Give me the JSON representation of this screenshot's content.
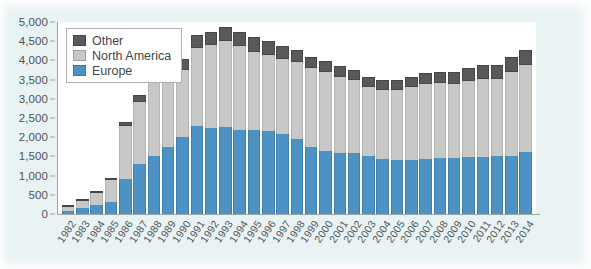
{
  "chart_data": {
    "type": "bar",
    "stacked": true,
    "title": "",
    "subtitle": "",
    "xlabel": "",
    "ylabel": "",
    "ylim": [
      0,
      5000
    ],
    "ytick_step": 500,
    "ytick_labels": [
      "0",
      "500",
      "1,000",
      "1,500",
      "2,000",
      "2,500",
      "3,000",
      "3,500",
      "4,000",
      "4,500",
      "5,000"
    ],
    "grid": false,
    "legend_position": "top-left",
    "legend_entries": [
      "Other",
      "North America",
      "Europe"
    ],
    "colors": {
      "other": "#58595b",
      "north_america": "#c8c9c6",
      "europe": "#4d92c4",
      "background": "#eaf3f4",
      "plot_background": "#ffffff",
      "axis": "#9aa6a8",
      "text": "#4b5356"
    },
    "categories": [
      "1982",
      "1983",
      "1984",
      "1985",
      "1986",
      "1987",
      "1988",
      "1989",
      "1990",
      "1991",
      "1992",
      "1993",
      "1994",
      "1995",
      "1996",
      "1997",
      "1998",
      "1999",
      "2000",
      "2001",
      "2002",
      "2003",
      "2004",
      "2005",
      "2006",
      "2007",
      "2008",
      "2009",
      "2010",
      "2011",
      "2012",
      "2013",
      "2014"
    ],
    "series": [
      {
        "name": "Europe",
        "values": [
          80,
          150,
          230,
          320,
          900,
          1300,
          1500,
          1750,
          2000,
          2280,
          2250,
          2270,
          2200,
          2180,
          2150,
          2080,
          1950,
          1750,
          1650,
          1600,
          1580,
          1500,
          1420,
          1400,
          1400,
          1430,
          1450,
          1450,
          1480,
          1480,
          1500,
          1520,
          1620
        ]
      },
      {
        "name": "North America",
        "values": [
          90,
          180,
          330,
          560,
          1380,
          1630,
          1900,
          1950,
          1750,
          2050,
          2150,
          2230,
          2170,
          2050,
          2000,
          1950,
          2000,
          2050,
          2050,
          1980,
          1900,
          1820,
          1800,
          1830,
          1900,
          1950,
          1950,
          1930,
          1980,
          2030,
          2020,
          2180,
          2250
        ]
      },
      {
        "name": "Other",
        "values": [
          20,
          30,
          50,
          70,
          120,
          170,
          200,
          250,
          300,
          320,
          350,
          370,
          380,
          370,
          360,
          340,
          330,
          300,
          290,
          280,
          270,
          260,
          260,
          270,
          280,
          290,
          300,
          320,
          330,
          360,
          360,
          400,
          400
        ]
      }
    ],
    "totals": [
      190,
      360,
      610,
      950,
      2400,
      3100,
      3600,
      3950,
      4050,
      4650,
      4750,
      4870,
      4750,
      4600,
      4510,
      4370,
      4280,
      4100,
      3990,
      3860,
      3750,
      3580,
      3480,
      3500,
      3580,
      3670,
      3700,
      3700,
      3790,
      3870,
      3880,
      4100,
      4270
    ]
  }
}
